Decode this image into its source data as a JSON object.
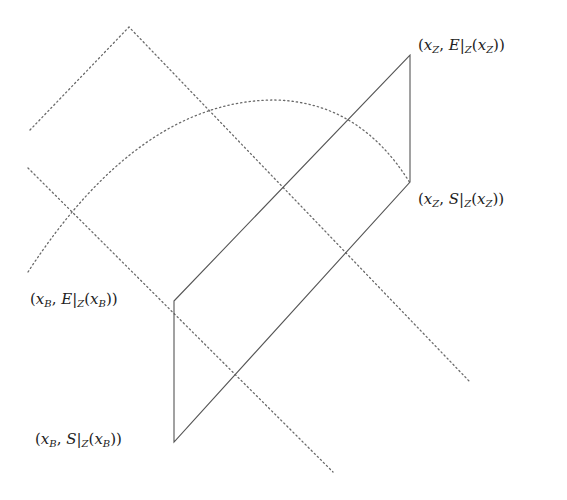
{
  "diagram": {
    "colors": {
      "solid_line": "#555555",
      "dotted_line": "#6a6a6a",
      "text": "#222222",
      "background": "#ffffff"
    },
    "labels": {
      "top_right": {
        "open": "(",
        "x": "x",
        "x_sub": "Z",
        "comma": ", ",
        "fn": "E",
        "bar": "|",
        "restr": "Z",
        "arg_open": "(",
        "arg_x": "x",
        "arg_sub": "Z",
        "close": "))"
      },
      "mid_right": {
        "open": "(",
        "x": "x",
        "x_sub": "Z",
        "comma": ", ",
        "fn": "S",
        "bar": "|",
        "restr": "Z",
        "arg_open": "(",
        "arg_x": "x",
        "arg_sub": "Z",
        "close": "))"
      },
      "mid_left": {
        "open": "(",
        "x": "x",
        "x_sub": "B",
        "comma": ", ",
        "fn": "E",
        "bar": "|",
        "restr": "Z",
        "arg_open": "(",
        "arg_x": "x",
        "arg_sub": "B",
        "close": "))"
      },
      "bottom_left": {
        "open": "(",
        "x": "x",
        "x_sub": "B",
        "comma": ", ",
        "fn": "S",
        "bar": "|",
        "restr": "Z",
        "arg_open": "(",
        "arg_x": "x",
        "arg_sub": "B",
        "close": "))"
      }
    },
    "points": {
      "xB_E": [
        174,
        301
      ],
      "xZ_E": [
        410,
        55
      ],
      "xZ_S": [
        410,
        182
      ],
      "xB_S": [
        174,
        442
      ]
    }
  }
}
